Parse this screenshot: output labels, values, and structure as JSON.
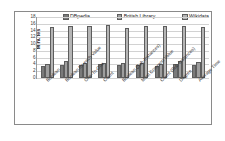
{
  "chart_data": {
    "type": "bar",
    "title": "",
    "xlabel": "",
    "ylabel": "Minutes",
    "ylim": [
      0,
      18
    ],
    "yticks": [
      18,
      16,
      14,
      12,
      10,
      8,
      6,
      4,
      2,
      0
    ],
    "grid": true,
    "legend_position": "top",
    "categories": [
      "Boolean",
      "Boolean for each Value",
      "One-To-One",
      "Count",
      "Boolean (Sub-Instances)",
      "Most Common Value",
      "Count (Sub-Instances)",
      "Degree",
      "Average Time"
    ],
    "series": [
      {
        "name": "DBpedia",
        "color": "#7a7a7a",
        "values": [
          3.6,
          3.7,
          3.7,
          4.0,
          3.9,
          3.8,
          3.5,
          4.1,
          3.8
        ]
      },
      {
        "name": "British Library",
        "color": "#9e9e9e",
        "values": [
          4.1,
          5.0,
          4.3,
          4.4,
          4.5,
          4.3,
          4.2,
          5.0,
          4.8
        ]
      },
      {
        "name": "Wikidata",
        "color": "#b5b5b5",
        "values": [
          15.0,
          15.4,
          15.3,
          15.6,
          14.9,
          15.3,
          15.3,
          15.3,
          15.1
        ]
      }
    ]
  },
  "axis": {
    "y_title": "Minutes"
  },
  "legend": {
    "items": [
      {
        "label": "DBpedia",
        "color": "#7a7a7a"
      },
      {
        "label": "British Library",
        "color": "#9e9e9e"
      },
      {
        "label": "Wikidata",
        "color": "#b5b5b5"
      }
    ]
  }
}
